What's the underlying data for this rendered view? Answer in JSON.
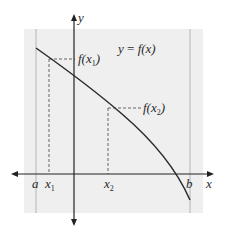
{
  "diagram": {
    "type": "function-graph",
    "equation_label": {
      "lhs": "y",
      "eq": " = ",
      "rhs": "f(x)"
    },
    "axes": {
      "x_label": "x",
      "y_label": "y"
    },
    "interval": {
      "left_label": "a",
      "right_label": "b"
    },
    "points": [
      {
        "x_label_base": "x",
        "x_label_sub": "1",
        "fx_label_prefix": "f(x",
        "fx_label_sub": "1",
        "fx_label_suffix": ")"
      },
      {
        "x_label_base": "x",
        "x_label_sub": "2",
        "fx_label_prefix": "f(x",
        "fx_label_sub": "2",
        "fx_label_suffix": ")"
      }
    ],
    "colors": {
      "panel": "#efefef",
      "axis": "#222222",
      "curve": "#2b2b2b",
      "guide": "#555555",
      "boundary": "#b5b5b5"
    }
  }
}
